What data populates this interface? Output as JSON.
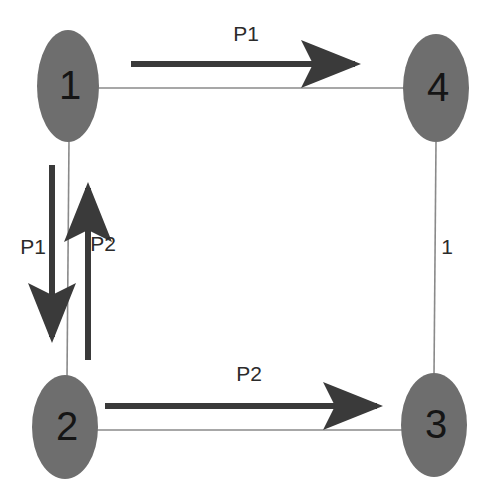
{
  "diagram": {
    "type": "directed-graph",
    "canvas": {
      "width": 491,
      "height": 502,
      "background": "#ffffff"
    },
    "style": {
      "node_fill": "#6e6e6e",
      "node_label_color": "#151515",
      "thin_edge_color": "#8a8a8a",
      "thick_arrow_color": "#3a3a3a",
      "label_color": "#2b2b2b"
    },
    "nodes": [
      {
        "id": "n1",
        "label": "1",
        "cx": 68,
        "cy": 86,
        "rx": 31,
        "ry": 56
      },
      {
        "id": "n4",
        "label": "4",
        "cx": 436,
        "cy": 88,
        "rx": 33,
        "ry": 54
      },
      {
        "id": "n2",
        "label": "2",
        "cx": 65,
        "cy": 427,
        "rx": 33,
        "ry": 52
      },
      {
        "id": "n3",
        "label": "3",
        "cx": 434,
        "cy": 425,
        "rx": 33,
        "ry": 52
      }
    ],
    "links": [
      {
        "id": "e14",
        "from": "1",
        "to": "4",
        "label": ""
      },
      {
        "id": "e12",
        "from": "1",
        "to": "2",
        "label": ""
      },
      {
        "id": "e23",
        "from": "2",
        "to": "3",
        "label": ""
      },
      {
        "id": "e34",
        "from": "3",
        "to": "4",
        "label": "1"
      }
    ],
    "paths": [
      {
        "id": "p1-top",
        "label": "P1",
        "from": "1",
        "to": "4",
        "direction": "right",
        "label_x": 246,
        "label_y": 35
      },
      {
        "id": "p1-left",
        "label": "P1",
        "from": "1",
        "to": "2",
        "direction": "down",
        "label_x": 33,
        "label_y": 248
      },
      {
        "id": "p2-left",
        "label": "P2",
        "from": "2",
        "to": "1",
        "direction": "up",
        "label_x": 103,
        "label_y": 245
      },
      {
        "id": "p2-bottom",
        "label": "P2",
        "from": "2",
        "to": "3",
        "direction": "right",
        "label_x": 249,
        "label_y": 375
      }
    ],
    "edge_weights": [
      {
        "id": "w34",
        "label": "1",
        "x": 444,
        "y": 248
      }
    ]
  }
}
